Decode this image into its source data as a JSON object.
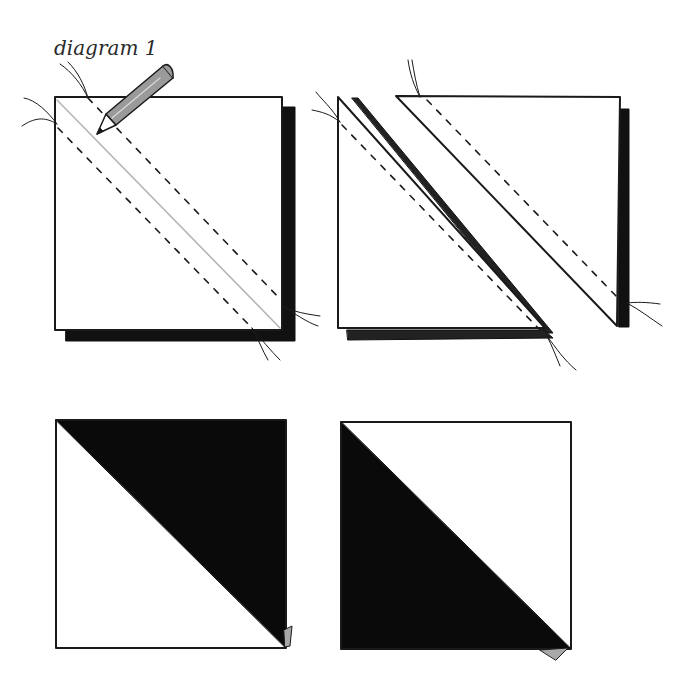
{
  "title": "diagram 1",
  "colors": {
    "ink": "#1a1a1a",
    "fabric_dark": "#111111",
    "pencil": "#9a9a9a",
    "pencil_line": "#b0b0b0",
    "dog_ear": "#a8a8a8"
  },
  "panels": [
    {
      "id": "step-1",
      "description": "Two squares stacked right sides together, diagonal pencil line marked with stitching lines 1/4 inch either side"
    },
    {
      "id": "step-2",
      "description": "Stitched square cut apart on the pencil line into two triangle units"
    },
    {
      "id": "step-3",
      "description": "Pressed half-square triangle unit, dark triangle top-right"
    },
    {
      "id": "step-4",
      "description": "Pressed half-square triangle unit, dark triangle bottom-left"
    }
  ]
}
